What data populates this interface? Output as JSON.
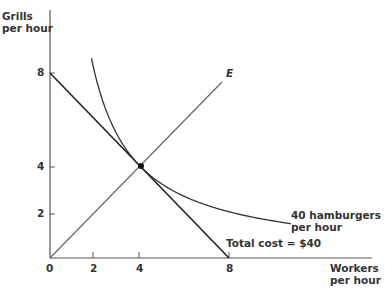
{
  "chart_data": {
    "type": "line",
    "title": "",
    "xlabel": "Workers per hour",
    "ylabel": "Grills per hour",
    "xlim": [
      0,
      9.5
    ],
    "ylim": [
      0,
      10
    ],
    "x_ticks": [
      "0",
      "2",
      "4",
      "8"
    ],
    "y_ticks": [
      "2",
      "4",
      "8"
    ],
    "grid": false,
    "series": [
      {
        "name": "Total cost = $40",
        "kind": "isocost",
        "points": [
          [
            0,
            8
          ],
          [
            8,
            0
          ]
        ]
      },
      {
        "name": "40 hamburgers per hour",
        "kind": "isoquant",
        "equation": "y = 16/x",
        "x_range": [
          1.8,
          9.5
        ]
      },
      {
        "name": "E",
        "kind": "expansion path",
        "points": [
          [
            0,
            0
          ],
          [
            8,
            8
          ]
        ]
      }
    ],
    "annotations": [
      {
        "text": "E",
        "at": [
          8,
          8
        ]
      },
      {
        "text": "tangency point",
        "at": [
          4,
          4
        ]
      }
    ]
  },
  "labels": {
    "y_axis_line1": "Grills",
    "y_axis_line2": "per hour",
    "x_axis_line1": "Workers",
    "x_axis_line2": "per hour",
    "isoquant_line1": "40 hamburgers",
    "isoquant_line2": "per hour",
    "isocost": "Total cost = $40",
    "expansion": "E",
    "x0": "0",
    "x2": "2",
    "x4": "4",
    "x8": "8",
    "y2": "2",
    "y4": "4",
    "y8": "8"
  }
}
